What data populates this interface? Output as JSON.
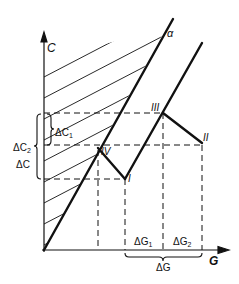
{
  "diagram": {
    "axes": {
      "y_label": "C",
      "x_label": "G"
    },
    "lines": {
      "alpha_label": "α"
    },
    "points": {
      "p1": "I",
      "p2": "II",
      "p3": "III",
      "p4": "IV"
    },
    "brackets": {
      "dc1": "ΔC",
      "dc1_sub": "1",
      "dc2": "ΔC",
      "dc2_sub": "2",
      "dc": "ΔC",
      "dg1": "ΔG",
      "dg1_sub": "1",
      "dg2": "ΔG",
      "dg2_sub": "2",
      "dg": "ΔG"
    },
    "colors": {
      "ink": "#111111",
      "background": "#ffffff"
    }
  }
}
